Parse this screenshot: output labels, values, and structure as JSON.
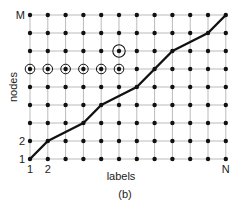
{
  "figure": {
    "caption": "(b)",
    "x_axis": {
      "title": "labels",
      "tick_labels": [
        {
          "text": "1",
          "col": 0
        },
        {
          "text": "2",
          "col": 1
        },
        {
          "text": "N",
          "col": 11
        }
      ]
    },
    "y_axis": {
      "title": "nodes",
      "tick_labels": [
        {
          "text": "1",
          "row": 0
        },
        {
          "text": "2",
          "row": 1
        },
        {
          "text": "M",
          "row": 8
        }
      ]
    },
    "grid": {
      "columns": 12,
      "rows": 9,
      "origin_x": 30,
      "origin_y": 159,
      "col_spacing": 17.8,
      "row_spacing": 18,
      "line_color": "#bbbbbb",
      "node_color": "#111111"
    },
    "path": {
      "color": "#111111",
      "points": [
        [
          0,
          0
        ],
        [
          1,
          1
        ],
        [
          3,
          2
        ],
        [
          4,
          3
        ],
        [
          6,
          4
        ],
        [
          8,
          6
        ],
        [
          10,
          7
        ],
        [
          11,
          8
        ]
      ]
    },
    "circled_nodes": {
      "row": 5,
      "cols": [
        0,
        1,
        2,
        3,
        4,
        5
      ]
    },
    "open_circle_node": {
      "col": 5,
      "row": 6
    }
  }
}
